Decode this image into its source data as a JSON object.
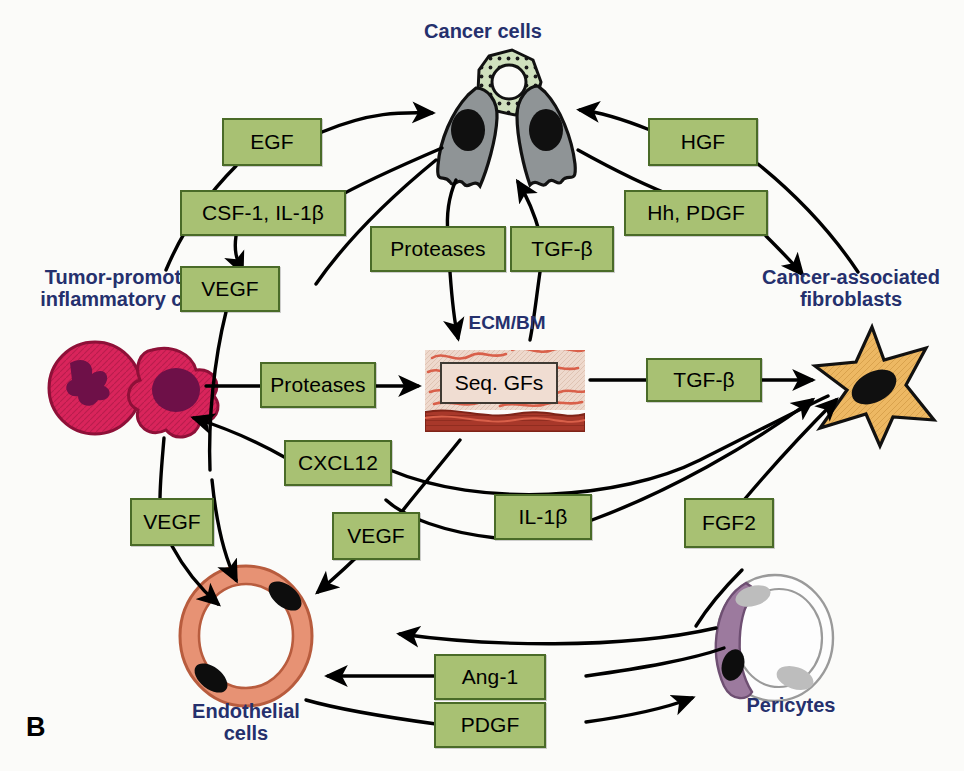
{
  "figure": {
    "panel_letter": "B",
    "colors": {
      "box_fill": "#a8c173",
      "box_border": "#4a6b28",
      "caption_text": "#25306d",
      "arrow": "#000000",
      "background": "#fbfbf9",
      "cancer_cell": "#8f9496",
      "dotted_cell": "#cfe0bd",
      "inflammatory_cell": "#d9245b",
      "inflammatory_nucleus": "#6e1048",
      "fibroblast": "#edb863",
      "endothelial": "#e79274",
      "pericyte": "#9c7a9e",
      "ecm_fiber": "#d9604a",
      "ecm_matrix": "#eed9cd",
      "basement_membrane": "#a8382a"
    }
  },
  "captions": [
    {
      "name": "cancer-cells",
      "text": "Cancer cells"
    },
    {
      "name": "inflammatory-cells",
      "text": "Tumor-promoting\ninflammatory cells"
    },
    {
      "name": "fibroblasts",
      "text": "Cancer-associated\nfibroblasts"
    },
    {
      "name": "ecm-bm",
      "text": "ECM/BM"
    },
    {
      "name": "endothelial-cells",
      "text": "Endothelial\ncells"
    },
    {
      "name": "pericytes",
      "text": "Pericytes"
    }
  ],
  "ligand_boxes": [
    {
      "id": "egf",
      "label": "EGF"
    },
    {
      "id": "csf1-il1b",
      "label": "CSF-1, IL-1β"
    },
    {
      "id": "vegf-upper",
      "label": "VEGF"
    },
    {
      "id": "proteases-upper",
      "label": "Proteases"
    },
    {
      "id": "tgfb-upper",
      "label": "TGF-β"
    },
    {
      "id": "hgf",
      "label": "HGF"
    },
    {
      "id": "hh-pdgf",
      "label": "Hh, PDGF"
    },
    {
      "id": "proteases-mid",
      "label": "Proteases"
    },
    {
      "id": "seq-gfs",
      "label": "Seq. GFs"
    },
    {
      "id": "tgfb-mid",
      "label": "TGF-β"
    },
    {
      "id": "cxcl12",
      "label": "CXCL12"
    },
    {
      "id": "vegf-left",
      "label": "VEGF"
    },
    {
      "id": "vegf-mid",
      "label": "VEGF"
    },
    {
      "id": "il1b",
      "label": "IL-1β"
    },
    {
      "id": "fgf2",
      "label": "FGF2"
    },
    {
      "id": "ang1",
      "label": "Ang-1"
    },
    {
      "id": "pdgf",
      "label": "PDGF"
    }
  ],
  "interactions": [
    {
      "from": "inflammatory-cells",
      "to": "cancer-cells",
      "ligand": "EGF"
    },
    {
      "from": "cancer-cells",
      "to": "inflammatory-cells",
      "ligand": "CSF-1, IL-1β"
    },
    {
      "from": "cancer-cells",
      "to": "endothelial-cells",
      "ligand": "VEGF"
    },
    {
      "from": "cancer-cells",
      "to": "ecm-bm",
      "ligand": "Proteases"
    },
    {
      "from": "ecm-bm",
      "to": "cancer-cells",
      "ligand": "TGF-β"
    },
    {
      "from": "fibroblasts",
      "to": "cancer-cells",
      "ligand": "HGF"
    },
    {
      "from": "cancer-cells",
      "to": "fibroblasts",
      "ligand": "Hh, PDGF"
    },
    {
      "from": "inflammatory-cells",
      "to": "ecm-bm",
      "ligand": "Proteases"
    },
    {
      "from": "ecm-bm",
      "to": "fibroblasts",
      "ligand": "TGF-β"
    },
    {
      "from": "fibroblasts",
      "to": "inflammatory-cells",
      "ligand": "CXCL12"
    },
    {
      "from": "inflammatory-cells",
      "to": "endothelial-cells",
      "ligand": "VEGF"
    },
    {
      "from": "ecm-bm",
      "to": "endothelial-cells",
      "ligand": "VEGF"
    },
    {
      "from": "endothelial-cells",
      "to": "fibroblasts",
      "ligand": "IL-1β"
    },
    {
      "from": "pericytes",
      "to": "fibroblasts",
      "ligand": "FGF2"
    },
    {
      "from": "pericytes",
      "to": "endothelial-cells",
      "ligand": "Ang-1"
    },
    {
      "from": "endothelial-cells",
      "to": "pericytes",
      "ligand": "PDGF"
    }
  ]
}
